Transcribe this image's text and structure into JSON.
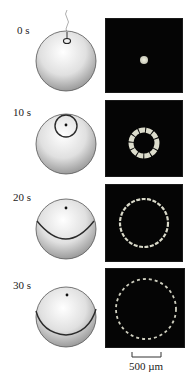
{
  "figure": {
    "rows": [
      {
        "time_label": "0 s",
        "stage": "injection-point",
        "fluorescence": "central-spot"
      },
      {
        "time_label": "10 s",
        "stage": "small-wave-ring",
        "fluorescence": "small-ring"
      },
      {
        "time_label": "20 s",
        "stage": "wave-past-equator",
        "fluorescence": "large-ring"
      },
      {
        "time_label": "30 s",
        "stage": "wave-near-vegetal",
        "fluorescence": "fragmented-large-ring"
      }
    ],
    "scale_bar": {
      "label": "500 µm"
    },
    "colors": {
      "panel_bg": "#050505",
      "signal": "#e8e8d8",
      "sphere_light": "#f4f4f4",
      "sphere_dark": "#9a9a9a",
      "wave_line": "#2a2a2a"
    }
  }
}
